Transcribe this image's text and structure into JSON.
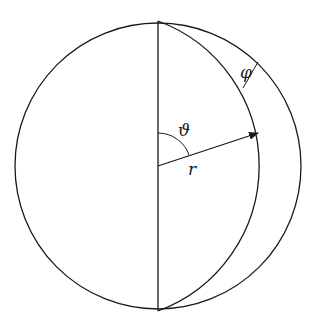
{
  "diagram": {
    "labels": {
      "theta": "ϑ",
      "r": "r",
      "phi": "φ"
    },
    "colors": {
      "stroke": "#1a1a1a",
      "background": "#ffffff"
    },
    "geometry": {
      "outer_circle": {
        "cx": 158,
        "cy": 166,
        "r": 143
      },
      "diameter": {
        "x1": 158,
        "y1": 21,
        "x2": 158,
        "y2": 311
      },
      "inner_arc_circle_center": {
        "cx": 107.5,
        "cy": 166,
        "r": 154.5
      },
      "radius_arrow": {
        "x1": 158,
        "y1": 166,
        "x2": 258,
        "y2": 133
      },
      "theta_arc_radius": 33,
      "phi_segment": {
        "x1": 243,
        "y1": 88,
        "x2": 258,
        "y2": 62
      }
    }
  }
}
